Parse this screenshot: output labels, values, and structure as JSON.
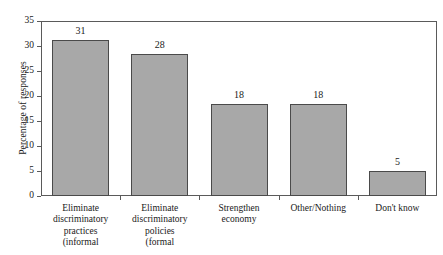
{
  "chart_data": {
    "type": "bar",
    "title": "",
    "subtitle": "",
    "xlabel": "",
    "ylabel": "Percentage of responses",
    "ylim": [
      0,
      35
    ],
    "ytick_step": 5,
    "ytick_labels": [
      "0",
      "5",
      "10",
      "15",
      "20",
      "25",
      "30",
      "35"
    ],
    "grid": false,
    "legend": null,
    "bar_color": "#a8a8a8",
    "bar_edge_color": "#4a4a4a",
    "frame_color": "#5a5a5a",
    "categories": [
      "Eliminate discriminatory practices (informal",
      "Eliminate discriminatory policies (formal",
      "Strengthen economy",
      "Other/Nothing",
      "Don't know"
    ],
    "category_lines": [
      [
        "Eliminate",
        "discriminatory",
        "practices",
        "(informal"
      ],
      [
        "Eliminate",
        "discriminatory",
        "policies",
        "(formal"
      ],
      [
        "Strengthen",
        "economy"
      ],
      [
        "Other/Nothing"
      ],
      [
        "Don't know"
      ]
    ],
    "values": [
      31,
      28,
      18,
      18,
      5
    ],
    "value_labels": [
      "31",
      "28",
      "18",
      "18",
      "5"
    ],
    "plotted_heights": [
      31.2,
      28.5,
      18.4,
      18.5,
      5.1
    ],
    "note": "First two category labels are clipped by the bottom edge of the image."
  }
}
